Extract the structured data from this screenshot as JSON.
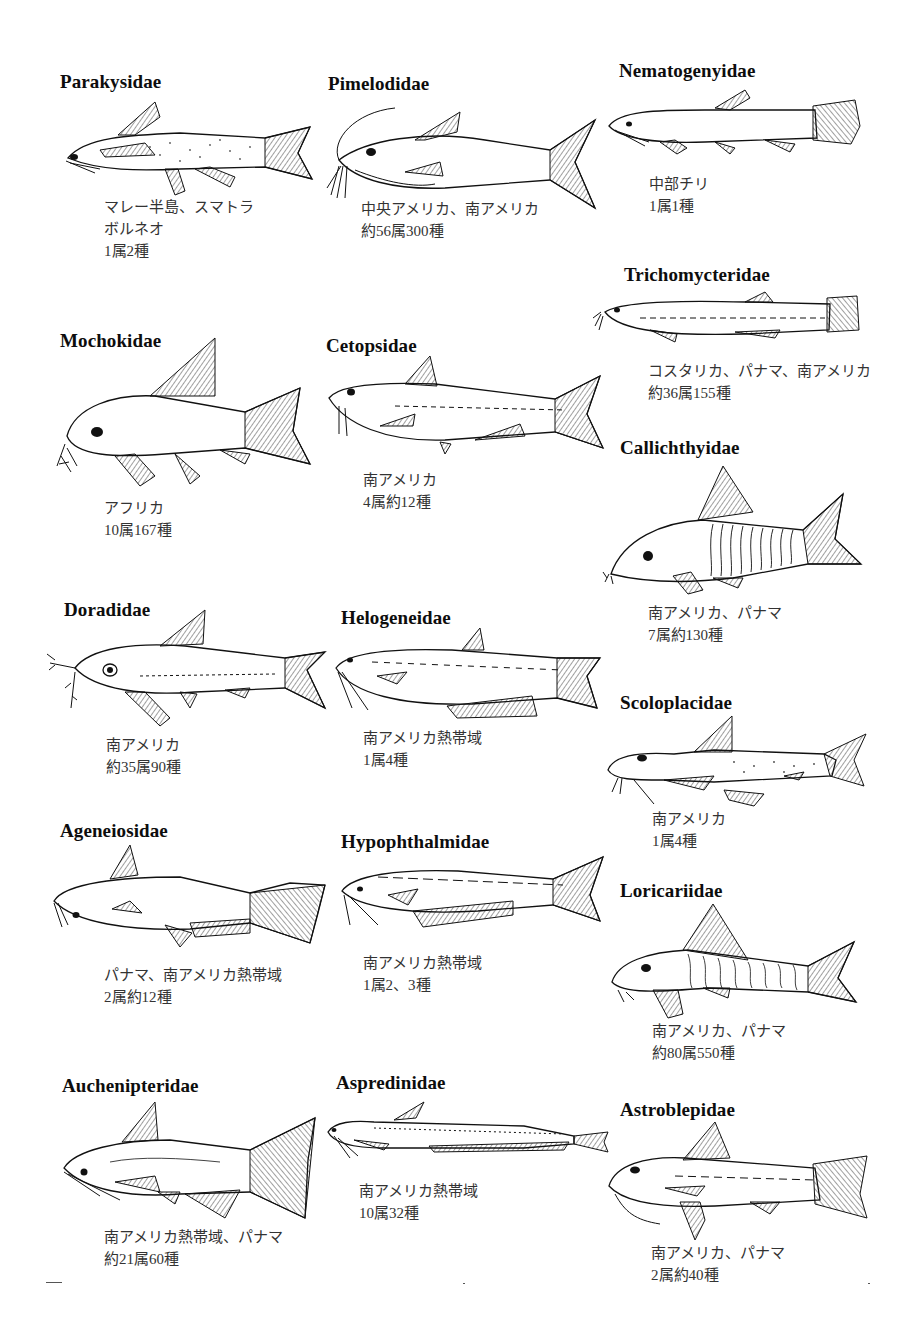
{
  "page": {
    "families": [
      {
        "name": "Parakysidae",
        "region": [
          "マレー半島、スマトラ",
          "ボルネオ"
        ],
        "count": "1属2種"
      },
      {
        "name": "Pimelodidae",
        "region": [
          "中央アメリカ、南アメリカ"
        ],
        "count": "約56属300種"
      },
      {
        "name": "Nematogenyidae",
        "region": [
          "中部チリ"
        ],
        "count": "1属1種"
      },
      {
        "name": "Trichomycteridae",
        "region": [
          "コスタリカ、パナマ、南アメリカ"
        ],
        "count": "約36属155種"
      },
      {
        "name": "Mochokidae",
        "region": [
          "アフリカ"
        ],
        "count": "10属167種"
      },
      {
        "name": "Cetopsidae",
        "region": [
          "南アメリカ"
        ],
        "count": "4属約12種"
      },
      {
        "name": "Callichthyidae",
        "region": [
          "南アメリカ、パナマ"
        ],
        "count": "7属約130種"
      },
      {
        "name": "Doradidae",
        "region": [
          "南アメリカ"
        ],
        "count": "約35属90種"
      },
      {
        "name": "Helogeneidae",
        "region": [
          "南アメリカ熱帯域"
        ],
        "count": "1属4種"
      },
      {
        "name": "Scoloplacidae",
        "region": [
          "南アメリカ"
        ],
        "count": "1属4種"
      },
      {
        "name": "Ageneiosidae",
        "region": [
          "パナマ、南アメリカ熱帯域"
        ],
        "count": "2属約12種"
      },
      {
        "name": "Hypophthalmidae",
        "region": [
          "南アメリカ熱帯域"
        ],
        "count": "1属2、3種"
      },
      {
        "name": "Loricariidae",
        "region": [
          "南アメリカ、パナマ"
        ],
        "count": "約80属550種"
      },
      {
        "name": "Auchenipteridae",
        "region": [
          "南アメリカ熱帯域、パナマ"
        ],
        "count": "約21属60種"
      },
      {
        "name": "Aspredinidae",
        "region": [
          "南アメリカ熱帯域"
        ],
        "count": "10属32種"
      },
      {
        "name": "Astroblepidae",
        "region": [
          "南アメリカ、パナマ"
        ],
        "count": "2属約40種"
      }
    ]
  }
}
